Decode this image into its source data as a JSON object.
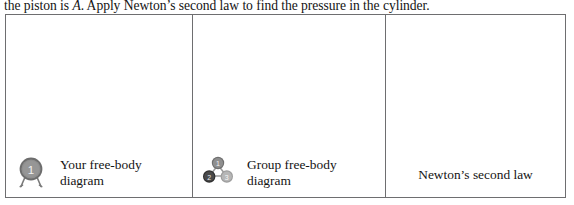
{
  "prompt": {
    "text_before_italic": "the piston is ",
    "italic_symbol": "A",
    "text_after_italic": ". Apply Newton’s second law to find the pressure in the cylinder."
  },
  "table": {
    "columns": [
      {
        "id": "your-free-body-diagram",
        "label": "Your free-body diagram",
        "icon": "single-person-badge-icon",
        "icon_numbers": [
          "1"
        ],
        "icon_colors": {
          "fill": "#8c8c8c",
          "ring": "#6d6d6d",
          "digit": "#ffffff",
          "legs": "#7a7a7a"
        },
        "content": ""
      },
      {
        "id": "group-free-body-diagram",
        "label": "Group free-body diagram",
        "icon": "group-of-three-icon",
        "icon_numbers": [
          "1",
          "2",
          "3"
        ],
        "icon_colors": {
          "node_top": "#8c8c8c",
          "node_left": "#4a4a4a",
          "node_right": "#b0b0b0",
          "link": "#9a9a9a",
          "digit": "#ffffff"
        },
        "content": ""
      },
      {
        "id": "newtons-second-law",
        "label": "Newton’s second law",
        "icon": null,
        "icon_numbers": [],
        "content": ""
      }
    ]
  },
  "style": {
    "border_color": "#6e6e70",
    "page_background": "#ffffff",
    "text_color": "#141414"
  }
}
